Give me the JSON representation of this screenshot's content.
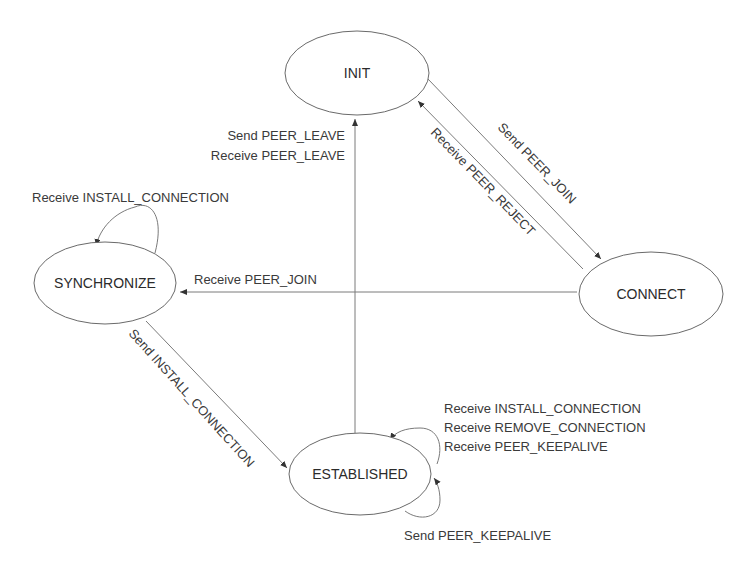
{
  "diagram": {
    "type": "state-machine",
    "states": {
      "init": "INIT",
      "synchronize": "SYNCHRONIZE",
      "connect": "CONNECT",
      "established": "ESTABLISHED"
    },
    "transitions": {
      "established_to_init": {
        "lines": [
          "Send PEER_LEAVE",
          "Receive PEER_LEAVE"
        ]
      },
      "init_to_connect": {
        "label": "Send PEER_JOIN"
      },
      "connect_to_init": {
        "label": "Receive PEER_REJECT"
      },
      "connect_to_synchronize": {
        "label": "Receive PEER_JOIN"
      },
      "synchronize_self": {
        "label": "Receive INSTALL_CONNECTION"
      },
      "synchronize_to_established": {
        "label": "Send INSTALL_CONNECTION"
      },
      "established_self_receive": {
        "lines": [
          "Receive INSTALL_CONNECTION",
          "Receive REMOVE_CONNECTION",
          "Receive PEER_KEEPALIVE"
        ]
      },
      "established_self_send": {
        "label": "Send PEER_KEEPALIVE"
      }
    },
    "colors": {
      "line": "#7a7a7a",
      "text": "#2b2b2b",
      "background": "#ffffff"
    }
  }
}
